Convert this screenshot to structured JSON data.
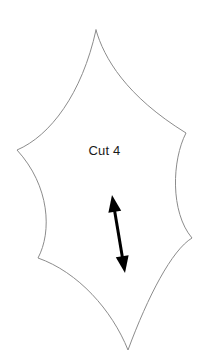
{
  "diagram": {
    "type": "sewing-pattern-piece",
    "title": "",
    "piece_label": "Cut 4",
    "outline": {
      "stroke_color": "#8c8c8c",
      "fill_color": "#ffffff",
      "stroke_width": 1,
      "shape": "six-pointed concave star",
      "points": [
        {
          "name": "top-apex",
          "x": 96,
          "y": 30
        },
        {
          "name": "right-upper",
          "x": 186,
          "y": 133
        },
        {
          "name": "right-lower",
          "x": 192,
          "y": 238
        },
        {
          "name": "bottom-apex",
          "x": 128,
          "y": 350
        },
        {
          "name": "left-lower",
          "x": 38,
          "y": 258
        },
        {
          "name": "left-upper",
          "x": 17,
          "y": 150
        }
      ]
    },
    "grainline_arrow": {
      "name": "grainline",
      "color": "#000000",
      "double_headed": true,
      "start_x": 112,
      "start_y": 195,
      "end_x": 125,
      "end_y": 273,
      "shaft_width": 3,
      "head_width": 13,
      "head_length": 17
    }
  }
}
